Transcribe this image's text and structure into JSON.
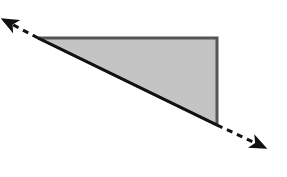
{
  "diagram": {
    "canvas": {
      "width": 287,
      "height": 177,
      "background": "#ffffff"
    },
    "triangle": {
      "points": [
        [
          38,
          38
        ],
        [
          217,
          38
        ],
        [
          217,
          125
        ]
      ],
      "fill": "#c4c4c4",
      "stroke": "#555555",
      "stroke_width": 3
    },
    "hypotenuse_line": {
      "start": [
        38,
        38
      ],
      "end": [
        217,
        125
      ],
      "stroke": "#111111",
      "stroke_width": 3
    },
    "dashed_arrow": {
      "from": [
        2,
        19
      ],
      "to": [
        266,
        148
      ],
      "stroke": "#111111",
      "stroke_width": 3,
      "dash": "6,5",
      "arrowheads": [
        "start",
        "end"
      ],
      "arrow_color": "#111111"
    }
  }
}
